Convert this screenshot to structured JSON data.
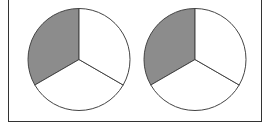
{
  "chart_data": [
    {
      "type": "pie",
      "title": "",
      "slices": [
        {
          "label": "",
          "value": 33.33,
          "color": "#8c8c8c",
          "shaded": true
        },
        {
          "label": "",
          "value": 33.33,
          "color": "#ffffff",
          "shaded": false
        },
        {
          "label": "",
          "value": 33.33,
          "color": "#ffffff",
          "shaded": false
        }
      ],
      "start_angle_deg": 90,
      "direction": "counterclockwise"
    },
    {
      "type": "pie",
      "title": "",
      "slices": [
        {
          "label": "",
          "value": 33.33,
          "color": "#8c8c8c",
          "shaded": true
        },
        {
          "label": "",
          "value": 33.33,
          "color": "#ffffff",
          "shaded": false
        },
        {
          "label": "",
          "value": 33.33,
          "color": "#ffffff",
          "shaded": false
        }
      ],
      "start_angle_deg": 90,
      "direction": "counterclockwise"
    }
  ],
  "colors": {
    "shaded": "#8c8c8c",
    "unshaded": "#ffffff",
    "stroke": "#444444",
    "frame": "#333333"
  }
}
